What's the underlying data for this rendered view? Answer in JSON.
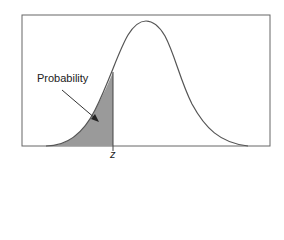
{
  "diagram": {
    "type": "normal-distribution-cdf",
    "label": "Probability",
    "z_label": "z",
    "colors": {
      "fill": "#9a9a9a",
      "line": "#555555",
      "frame": "#666666"
    }
  }
}
